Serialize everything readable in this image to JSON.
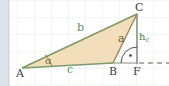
{
  "figure": {
    "background_color": "#ffffff",
    "grid_color": "#e4ebe4",
    "left_strip_color": "#dde3ea",
    "triangle_fill": "#f2debb",
    "triangle_stroke": "#7d9a6b"
  },
  "vertices": {
    "a": "A",
    "b": "B",
    "c": "C",
    "f": "F"
  },
  "sides": {
    "a": "a",
    "b": "b",
    "c": "c"
  },
  "altitude": {
    "symbol": "h",
    "subscript": "c"
  },
  "angles": {
    "alpha": "α",
    "right_angle_marker": "·"
  },
  "colors": {
    "side_a": "#6b5a33",
    "side_b": "#5d9167",
    "side_c": "#5d9167",
    "altitude": "#4d7a52",
    "alpha": "#6f6a31",
    "vertex": "#3a3f3a"
  },
  "geometry": {
    "A": [
      22,
      68
    ],
    "B": [
      113,
      63
    ],
    "C": [
      137,
      14
    ],
    "F": [
      137,
      63
    ],
    "dashed_line_end": [
      169,
      63
    ]
  }
}
